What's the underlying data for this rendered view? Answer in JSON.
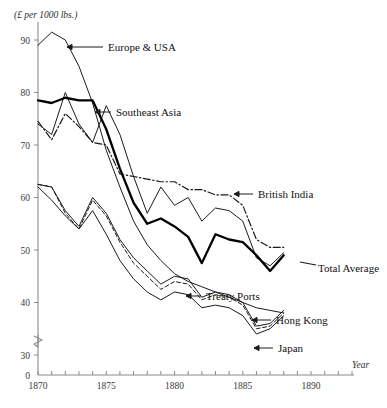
{
  "chart_data": {
    "type": "line",
    "title": "",
    "subtitle": "",
    "ylabel": "(£ per 1000 lbs.)",
    "xlabel": "Year",
    "xlim": [
      1870,
      1893
    ],
    "ylim": [
      30,
      92
    ],
    "axis_break": true,
    "axis_break_value": 0,
    "grid": false,
    "legend_position": "inline-annotations",
    "x_ticks": [
      1870,
      1871,
      1872,
      1873,
      1874,
      1875,
      1876,
      1877,
      1878,
      1879,
      1880,
      1881,
      1882,
      1883,
      1884,
      1885,
      1886,
      1887,
      1888,
      1889,
      1890,
      1891,
      1892,
      1893
    ],
    "x_tick_labels": [
      "1870",
      "",
      "",
      "",
      "",
      "1875",
      "",
      "",
      "",
      "",
      "1880",
      "",
      "",
      "",
      "",
      "1885",
      "",
      "",
      "",
      "",
      "1890",
      "",
      "",
      ""
    ],
    "y_ticks": [
      0,
      30,
      40,
      50,
      60,
      70,
      80,
      90
    ],
    "y_tick_labels": [
      "0",
      "30",
      "40",
      "50",
      "60",
      "70",
      "80",
      "90"
    ],
    "x": [
      1870,
      1871,
      1872,
      1873,
      1874,
      1875,
      1876,
      1877,
      1878,
      1879,
      1880,
      1881,
      1882,
      1883,
      1884,
      1885,
      1886,
      1887,
      1888
    ],
    "series": [
      {
        "name": "Europe & USA",
        "style": "solid-thin",
        "color": "#1a1a1a",
        "values": [
          89.0,
          91.5,
          90.0,
          85.0,
          78.0,
          69.0,
          62.0,
          55.5,
          51.0,
          48.0,
          45.5,
          44.0,
          43.0,
          42.0,
          41.0,
          40.0,
          39.0,
          38.5,
          38.0
        ]
      },
      {
        "name": "Southeast Asia",
        "style": "solid-thin",
        "color": "#1a1a1a",
        "values": [
          74.0,
          72.0,
          80.0,
          74.0,
          70.5,
          77.5,
          72.0,
          64.0,
          57.0,
          62.0,
          58.5,
          60.0,
          55.5,
          58.0,
          57.5,
          55.5,
          48.5,
          47.0,
          49.5
        ]
      },
      {
        "name": "British India",
        "style": "dash-dot",
        "color": "#1a1a1a",
        "values": [
          74.5,
          71.0,
          76.0,
          73.5,
          70.5,
          70.0,
          64.5,
          64.0,
          63.5,
          63.0,
          63.0,
          61.5,
          61.5,
          60.5,
          60.5,
          58.5,
          52.0,
          50.5,
          50.5
        ]
      },
      {
        "name": "Total Average",
        "style": "solid-thick",
        "color": "#000000",
        "values": [
          78.5,
          78.0,
          79.0,
          78.5,
          78.5,
          73.0,
          65.5,
          59.0,
          55.0,
          56.0,
          54.5,
          52.5,
          47.5,
          53.0,
          52.0,
          51.5,
          49.0,
          46.0,
          49.0
        ]
      },
      {
        "name": "Treaty Ports",
        "style": "solid-thin",
        "color": "#1a1a1a",
        "values": [
          62.5,
          62.0,
          57.5,
          54.5,
          60.0,
          57.0,
          52.0,
          48.5,
          46.0,
          43.5,
          45.0,
          44.5,
          41.0,
          42.0,
          41.5,
          40.0,
          35.5,
          36.0,
          38.5
        ]
      },
      {
        "name": "Hong Kong",
        "style": "dashed",
        "color": "#1a1a1a",
        "values": [
          62.5,
          62.0,
          57.0,
          54.0,
          59.5,
          56.5,
          51.5,
          47.5,
          45.0,
          42.5,
          44.0,
          43.5,
          40.5,
          41.5,
          41.0,
          39.5,
          35.0,
          35.5,
          38.0
        ]
      },
      {
        "name": "Japan",
        "style": "solid-thin",
        "color": "#1a1a1a",
        "values": [
          62.0,
          59.5,
          56.5,
          54.0,
          57.5,
          53.0,
          48.0,
          44.5,
          42.0,
          40.5,
          42.0,
          41.5,
          39.0,
          39.5,
          39.0,
          37.5,
          34.0,
          35.0,
          37.5
        ]
      }
    ],
    "annotations": [
      {
        "label": "Europe & USA",
        "arrow": "left",
        "text_x": 108,
        "text_y": 47,
        "arrow_from_x": 103,
        "arrow_to_x": 67,
        "arrow_y": 47
      },
      {
        "label": "Southeast Asia",
        "arrow": "left",
        "text_x": 116,
        "text_y": 112,
        "arrow_from_x": 111,
        "arrow_to_x": 95,
        "arrow_y": 112
      },
      {
        "label": "British India",
        "arrow": "left",
        "text_x": 258,
        "text_y": 194,
        "arrow_from_x": 253,
        "arrow_to_x": 234,
        "arrow_y": 194
      },
      {
        "label": "Total Average",
        "arrow": "line",
        "text_x": 318,
        "text_y": 268,
        "arrow_from_x": 316,
        "arrow_to_x": 300,
        "arrow_y": 265
      },
      {
        "label": "Treaty Ports",
        "arrow": "left",
        "text_x": 206,
        "text_y": 296,
        "arrow_from_x": 201,
        "arrow_to_x": 186,
        "arrow_y": 296
      },
      {
        "label": "Hong Kong",
        "arrow": "left",
        "text_x": 276,
        "text_y": 320,
        "arrow_from_x": 271,
        "arrow_to_x": 252,
        "arrow_y": 320
      },
      {
        "label": "Japan",
        "arrow": "left",
        "text_x": 278,
        "text_y": 348,
        "arrow_from_x": 273,
        "arrow_to_x": 254,
        "arrow_y": 348
      }
    ]
  }
}
